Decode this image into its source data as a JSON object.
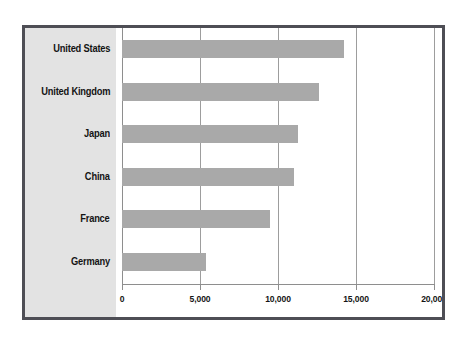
{
  "chart_data": {
    "type": "bar",
    "orientation": "horizontal",
    "title": "",
    "subtitle": "",
    "xlabel": "",
    "ylabel": "",
    "categories": [
      "United States",
      "United Kingdom",
      "Japan",
      "China",
      "France",
      "Germany"
    ],
    "values": [
      14200,
      12600,
      11300,
      11000,
      9500,
      5400
    ],
    "series": [
      {
        "name": "",
        "values": [
          14200,
          12600,
          11300,
          11000,
          9500,
          5400
        ]
      }
    ],
    "xlim": [
      0,
      20000
    ],
    "xticks": [
      0,
      5000,
      10000,
      15000,
      20000
    ],
    "xtick_labels": [
      "0",
      "5,000",
      "10,000",
      "15,000",
      "20,000"
    ],
    "grid": true,
    "grid_axis": "x",
    "legend": false,
    "legend_position": "none",
    "bar_color": "#a9a9a9",
    "label_panel_color": "#e3e3e3",
    "frame_color": "#4e4e55",
    "grid_color": "#9d9d9d"
  },
  "chart": {
    "bars": [
      {
        "label": "United States",
        "value": 14200
      },
      {
        "label": "United Kingdom",
        "value": 12600
      },
      {
        "label": "Japan",
        "value": 11300
      },
      {
        "label": "China",
        "value": 11000
      },
      {
        "label": "France",
        "value": 9500
      },
      {
        "label": "Germany",
        "value": 5400
      }
    ],
    "ticks": [
      {
        "label": "0",
        "value": 0
      },
      {
        "label": "5,000",
        "value": 5000
      },
      {
        "label": "10,000",
        "value": 10000
      },
      {
        "label": "15,000",
        "value": 15000
      },
      {
        "label": "20,000",
        "value": 20000
      }
    ]
  }
}
